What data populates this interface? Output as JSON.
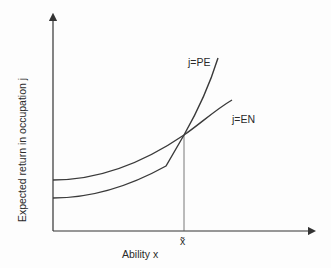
{
  "diagram": {
    "y_axis_label": "Expected return in occupation j",
    "x_axis_label": "Ability x",
    "threshold_label": "x̃",
    "curves": [
      {
        "id": "PE",
        "label": "j=PE",
        "description": "lower at low ability, kinked, steeper, overtakes EN beyond threshold"
      },
      {
        "id": "EN",
        "label": "j=EN",
        "description": "higher at low ability, smooth convex, flatter beyond threshold"
      }
    ],
    "annotation": "curves intersect at threshold ability x̃"
  }
}
